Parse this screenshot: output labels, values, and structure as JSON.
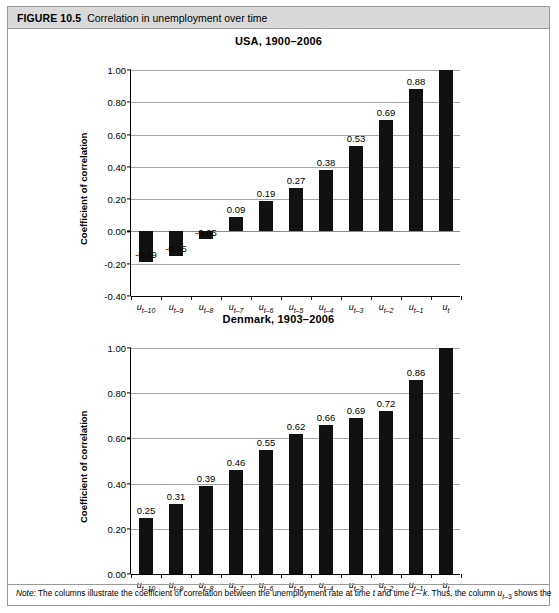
{
  "figure": {
    "number": "FIGURE 10.5",
    "caption": "Correlation in unemployment over time",
    "note_prefix": "Note:",
    "note_text": "The columns illustrate the coefficient of correlation between the unemployment rate at time t and time t – k. Thus, the column uₜ₋₃ shows the"
  },
  "colors": {
    "bar": "#111111",
    "grid": "#a6a6a6",
    "axis": "#000000",
    "header_bg": "#d9d9d9",
    "frame_border": "#9a9a9a"
  },
  "chart_data": [
    {
      "type": "bar",
      "id": "usa",
      "title": "USA, 1900–2006",
      "xlabel": "",
      "ylabel": "Coefficient of correlation",
      "ylim": [
        -0.4,
        1.0
      ],
      "ytick_step": 0.2,
      "ytick_labels": [
        "1.00",
        "0.80",
        "0.60",
        "0.40",
        "0.20",
        "0.00",
        "-0.20",
        "-0.40"
      ],
      "ytick_values": [
        1.0,
        0.8,
        0.6,
        0.4,
        0.2,
        0.0,
        -0.2,
        -0.4
      ],
      "grid": true,
      "legend": "none",
      "categories": [
        "u_t-10",
        "u_t-9",
        "u_t-8",
        "u_t-7",
        "u_t-6",
        "u_t-5",
        "u_t-4",
        "u_t-3",
        "u_t-2",
        "u_t-1",
        "u_t"
      ],
      "category_labels": [
        "u",
        "u",
        "u",
        "u",
        "u",
        "u",
        "u",
        "u",
        "u",
        "u",
        "u"
      ],
      "category_subs": [
        "t-10",
        "t-9",
        "t-8",
        "t-7",
        "t-6",
        "t-5",
        "t-4",
        "t-3",
        "t-2",
        "t-1",
        "t"
      ],
      "values": [
        -0.19,
        -0.15,
        -0.05,
        0.09,
        0.19,
        0.27,
        0.38,
        0.53,
        0.69,
        0.88,
        1.0
      ],
      "value_labels": [
        "-0.19",
        "-0.15",
        "-0.05",
        "0.09",
        "0.19",
        "0.27",
        "0.38",
        "0.53",
        "0.69",
        "0.88",
        ""
      ]
    },
    {
      "type": "bar",
      "id": "denmark",
      "title": "Denmark, 1903–2006",
      "xlabel": "",
      "ylabel": "Coefficient of correlation",
      "ylim": [
        0.0,
        1.0
      ],
      "ytick_step": 0.2,
      "ytick_labels": [
        "1.00",
        "0.80",
        "0.60",
        "0.40",
        "0.20",
        "0.00"
      ],
      "ytick_values": [
        1.0,
        0.8,
        0.6,
        0.4,
        0.2,
        0.0
      ],
      "grid": true,
      "legend": "none",
      "categories": [
        "u_t-10",
        "u_t-9",
        "u_t-8",
        "u_t-7",
        "u_t-6",
        "u_t-5",
        "u_t-4",
        "u_t-3",
        "u_t-2",
        "u_t-1",
        "u_t"
      ],
      "category_labels": [
        "u",
        "u",
        "u",
        "u",
        "u",
        "u",
        "u",
        "u",
        "u",
        "u",
        "u"
      ],
      "category_subs": [
        "t-10",
        "t-9",
        "t-8",
        "t-7",
        "t-6",
        "t-5",
        "t-4",
        "t-3",
        "t-2",
        "t-1",
        "t"
      ],
      "values": [
        0.25,
        0.31,
        0.39,
        0.46,
        0.55,
        0.62,
        0.66,
        0.69,
        0.72,
        0.86,
        1.0
      ],
      "value_labels": [
        "0.25",
        "0.31",
        "0.39",
        "0.46",
        "0.55",
        "0.62",
        "0.66",
        "0.69",
        "0.72",
        "0.86",
        ""
      ]
    }
  ]
}
